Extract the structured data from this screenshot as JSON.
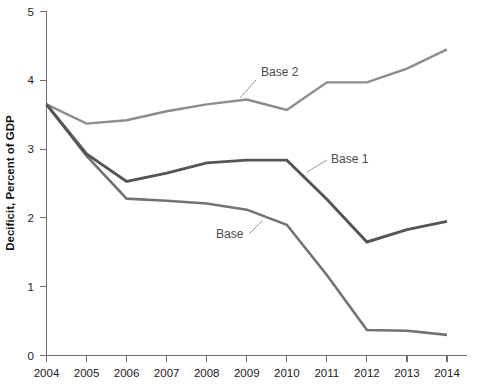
{
  "chart_data": {
    "type": "line",
    "title": "",
    "xlabel": "",
    "ylabel": "Decificit, Percent of GDP",
    "categories": [
      "2004",
      "2005",
      "2006",
      "2007",
      "2008",
      "2009",
      "2010",
      "2011",
      "2012",
      "2013",
      "2014"
    ],
    "x": [
      2004,
      2005,
      2006,
      2007,
      2008,
      2009,
      2010,
      2011,
      2012,
      2013,
      2014
    ],
    "xlim": [
      2004,
      2014
    ],
    "ylim": [
      0,
      5
    ],
    "yticks": [
      "0",
      "1",
      "2",
      "3",
      "4",
      "5"
    ],
    "ytick_values": [
      0,
      1,
      2,
      3,
      4,
      5
    ],
    "grid": false,
    "legend": "inline-annotations",
    "series": [
      {
        "name": "Base",
        "color": "#737373",
        "stroke_width": 2.6,
        "values": [
          3.65,
          2.9,
          2.28,
          2.25,
          2.21,
          2.12,
          1.9,
          1.17,
          0.37,
          0.36,
          0.3
        ]
      },
      {
        "name": "Base 1",
        "color": "#555555",
        "stroke_width": 2.9,
        "values": [
          3.65,
          2.93,
          2.53,
          2.65,
          2.8,
          2.84,
          2.84,
          2.27,
          1.65,
          1.83,
          1.95
        ]
      },
      {
        "name": "Base 2",
        "color": "#8c8c8c",
        "stroke_width": 2.4,
        "values": [
          3.65,
          3.37,
          3.42,
          3.55,
          3.65,
          3.72,
          3.57,
          3.97,
          3.97,
          4.17,
          4.45
        ]
      }
    ],
    "annotations": [
      {
        "text": "Base 2",
        "x": 261,
        "y": 76,
        "leader": [
          [
            256,
            80
          ],
          [
            240,
            98
          ]
        ]
      },
      {
        "text": "Base 1",
        "x": 331,
        "y": 163,
        "leader": [
          [
            327,
            160
          ],
          [
            307,
            172
          ]
        ]
      },
      {
        "text": "Base",
        "x": 216,
        "y": 238,
        "leader": [
          [
            249,
            234
          ],
          [
            262,
            221
          ]
        ]
      }
    ]
  },
  "axis": {
    "y_title": "Decificit, Percent of GDP"
  }
}
